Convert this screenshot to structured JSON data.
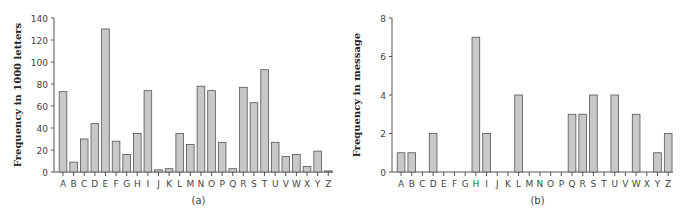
{
  "chart_data": [
    {
      "type": "bar",
      "title": "",
      "caption": "(a)",
      "xlabel": "",
      "ylabel": "Frequency in 1000 letters",
      "ylim": [
        0,
        140
      ],
      "yticks": [
        0,
        20,
        40,
        60,
        80,
        100,
        120,
        140
      ],
      "grid": false,
      "categories": [
        "A",
        "B",
        "C",
        "D",
        "E",
        "F",
        "G",
        "H",
        "I",
        "J",
        "K",
        "L",
        "M",
        "N",
        "O",
        "P",
        "Q",
        "R",
        "S",
        "T",
        "U",
        "V",
        "W",
        "X",
        "Y",
        "Z"
      ],
      "values": [
        73,
        9,
        30,
        44,
        130,
        28,
        16,
        35,
        74,
        2,
        3,
        35,
        25,
        78,
        74,
        27,
        3,
        77,
        63,
        93,
        27,
        14,
        16,
        5,
        19,
        1
      ]
    },
    {
      "type": "bar",
      "title": "",
      "caption": "(b)",
      "xlabel": "",
      "ylabel": "Frequency in message",
      "ylim": [
        0,
        8
      ],
      "yticks": [
        0,
        2,
        4,
        6,
        8
      ],
      "grid": false,
      "categories": [
        "A",
        "B",
        "C",
        "D",
        "E",
        "F",
        "G",
        "H",
        "I",
        "J",
        "K",
        "L",
        "M",
        "N",
        "O",
        "P",
        "Q",
        "R",
        "S",
        "T",
        "U",
        "V",
        "W",
        "X",
        "Y",
        "Z"
      ],
      "values": [
        1,
        1,
        0,
        2,
        0,
        0,
        0,
        7,
        2,
        0,
        0,
        4,
        0,
        0,
        0,
        0,
        3,
        3,
        4,
        0,
        4,
        0,
        3,
        0,
        1,
        2
      ]
    }
  ],
  "colors": {
    "bar_fill": "#c8c8c8",
    "bar_stroke": "#555555",
    "axis": "#555555"
  }
}
